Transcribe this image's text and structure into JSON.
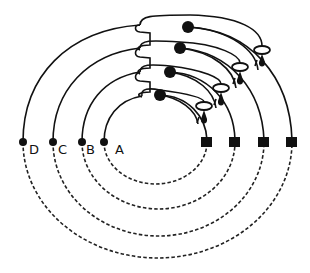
{
  "diagram": {
    "type": "concentric ring loops with terminals",
    "colors": {
      "stroke": "#111111",
      "background": "#ffffff"
    },
    "rings": [
      {
        "label": "A",
        "left_node": [
          104,
          142
        ],
        "right_terminal": [
          207,
          142
        ],
        "cx": 155.5,
        "rx": 51.5,
        "ry_top": 45,
        "ry_bottom": 42,
        "bead": [
          160,
          95
        ],
        "ring_marker": [
          204,
          106
        ]
      },
      {
        "label": "B",
        "left_node": [
          82,
          142
        ],
        "right_terminal": [
          235,
          142
        ],
        "cx": 158.5,
        "rx": 76.5,
        "ry_top": 70,
        "ry_bottom": 67,
        "bead": [
          170,
          72
        ],
        "ring_marker": [
          221,
          88
        ]
      },
      {
        "label": "C",
        "left_node": [
          53,
          142
        ],
        "right_terminal": [
          264,
          142
        ],
        "cx": 158.5,
        "rx": 105.5,
        "ry_top": 95,
        "ry_bottom": 94,
        "bead": [
          180,
          48
        ],
        "ring_marker": [
          240,
          67
        ]
      },
      {
        "label": "D",
        "left_node": [
          23,
          142
        ],
        "right_terminal": [
          292,
          142
        ],
        "cx": 157.5,
        "rx": 134.5,
        "ry_top": 120,
        "ry_bottom": 116,
        "bead": [
          188,
          27
        ],
        "ring_marker": [
          262,
          50
        ]
      }
    ],
    "legend": {
      "solid_line": "upper path",
      "dashed_line": "lower return path",
      "square": "terminal",
      "dot": "node"
    }
  }
}
